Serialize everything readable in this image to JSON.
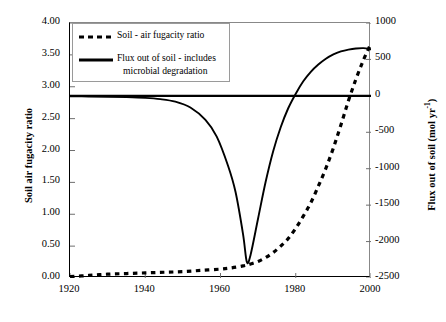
{
  "chart_data": {
    "type": "line",
    "title": "",
    "xlabel": "",
    "ylabel": "Soil air fugacity ratio",
    "y2label": "Flux out of soil (mol yr-1)",
    "xlim": [
      1920,
      2000
    ],
    "ylim": [
      0.0,
      4.0
    ],
    "y2lim": [
      -2500,
      1000
    ],
    "grid": false,
    "legend_position": "top-left",
    "xticks": [
      "1920",
      "1940",
      "1960",
      "1980",
      "2000"
    ],
    "yticks": [
      "0.00",
      "0.50",
      "1.00",
      "1.50",
      "2.00",
      "2.50",
      "3.00",
      "3.50",
      "4.00"
    ],
    "y2ticks": [
      "-2500",
      "-2000",
      "-1500",
      "-1000",
      "-500",
      "0",
      "500",
      "1000"
    ],
    "series": [
      {
        "name": "Soil - air fugacity ratio",
        "style": "dashed",
        "axis": "left",
        "x": [
          1920,
          1925,
          1930,
          1935,
          1940,
          1945,
          1950,
          1955,
          1960,
          1963,
          1966,
          1968,
          1970,
          1972,
          1974,
          1976,
          1978,
          1980,
          1982,
          1984,
          1986,
          1988,
          1990,
          1992,
          1994,
          1996,
          1998,
          2000
        ],
        "values": [
          0.02,
          0.04,
          0.06,
          0.07,
          0.08,
          0.09,
          0.1,
          0.12,
          0.14,
          0.16,
          0.19,
          0.22,
          0.26,
          0.32,
          0.4,
          0.5,
          0.62,
          0.78,
          0.97,
          1.18,
          1.44,
          1.72,
          2.04,
          2.4,
          2.78,
          3.12,
          3.42,
          3.68
        ]
      },
      {
        "name": "Flux out of soil - includes microbial degradation",
        "style": "solid",
        "axis": "right",
        "x": [
          1920,
          1925,
          1930,
          1935,
          1940,
          1944,
          1948,
          1952,
          1956,
          1959,
          1962,
          1964,
          1966,
          1967,
          1968,
          1970,
          1972,
          1974,
          1976,
          1978,
          1980,
          1982,
          1984,
          1986,
          1988,
          1990,
          1992,
          1994,
          1996,
          1998,
          2000
        ],
        "values": [
          -5,
          -8,
          -12,
          -18,
          -28,
          -45,
          -80,
          -160,
          -330,
          -560,
          -960,
          -1320,
          -1900,
          -2280,
          -2180,
          -1680,
          -1180,
          -760,
          -430,
          -170,
          30,
          200,
          330,
          430,
          510,
          570,
          610,
          635,
          650,
          655,
          640
        ]
      }
    ],
    "reference_line": {
      "name": "zero-flux-line",
      "axis": "right",
      "value": 0
    }
  },
  "legend": {
    "entry1": "Soil - air fugacity ratio",
    "entry2_line1": "Flux out of soil - includes",
    "entry2_line2": "microbial degradation"
  },
  "axes": {
    "left_title": "Soil air fugacity ratio",
    "right_title_main": "Flux out of soil (mol yr",
    "right_title_sup": "-1",
    "right_title_end": ")"
  },
  "colors": {
    "line": "#000000",
    "axis": "#000000",
    "frame": "#8a8a8a",
    "background": "#ffffff"
  }
}
